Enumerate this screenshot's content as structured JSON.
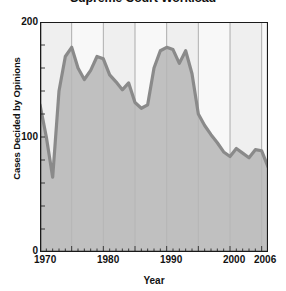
{
  "chart_data": {
    "type": "line",
    "title": "Supreme Court Workload",
    "xlabel": "Year",
    "ylabel": "Cases Decided by Opinions",
    "xlim": [
      1970,
      2006
    ],
    "ylim": [
      0,
      200
    ],
    "yticks": [
      0,
      100,
      200
    ],
    "xticks": [
      1970,
      1980,
      1990,
      2000,
      2006
    ],
    "xtick_labels": [
      "1970",
      "1980",
      "1990",
      "2000",
      "2006"
    ],
    "ytick_labels": [
      "0",
      "100",
      "200"
    ],
    "grid": "vertical gridlines every 5 years, alternating light/white vertical bands",
    "legend": "none",
    "fill": "area under curve shaded gray",
    "line_color": "#8a8a8a",
    "fill_color": "#b6b6b6",
    "band_color_a": "#efefef",
    "band_color_b": "#f8f8f8",
    "axis_color": "#1a1a1a",
    "x": [
      1970,
      1971,
      1972,
      1973,
      1974,
      1975,
      1976,
      1977,
      1978,
      1979,
      1980,
      1981,
      1982,
      1983,
      1984,
      1985,
      1986,
      1987,
      1988,
      1989,
      1990,
      1991,
      1992,
      1993,
      1994,
      1995,
      1996,
      1997,
      1998,
      1999,
      2000,
      2001,
      2002,
      2003,
      2004,
      2005,
      2006
    ],
    "values": [
      128,
      100,
      65,
      140,
      170,
      178,
      160,
      150,
      158,
      170,
      168,
      154,
      148,
      141,
      147,
      130,
      125,
      128,
      160,
      175,
      178,
      176,
      164,
      175,
      155,
      120,
      110,
      102,
      95,
      87,
      83,
      90,
      86,
      82,
      89,
      88,
      74
    ],
    "series": [
      {
        "name": "Cases Decided by Opinions",
        "values": [
          128,
          100,
          65,
          140,
          170,
          178,
          160,
          150,
          158,
          170,
          168,
          154,
          148,
          141,
          147,
          130,
          125,
          128,
          160,
          175,
          178,
          176,
          164,
          175,
          155,
          120,
          110,
          102,
          95,
          87,
          83,
          90,
          86,
          82,
          89,
          88,
          74
        ]
      }
    ],
    "annotations": []
  }
}
